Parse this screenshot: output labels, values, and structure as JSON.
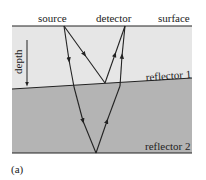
{
  "labels": {
    "source": "source",
    "detector": "detector",
    "surface": "surface",
    "depth": "depth",
    "reflector1": "reflector 1",
    "reflector2": "reflector 2",
    "panel": "(a)"
  },
  "colors": {
    "layer1": "#e6e6e6",
    "layer2": "#b4b4b4",
    "line": "#222222"
  }
}
